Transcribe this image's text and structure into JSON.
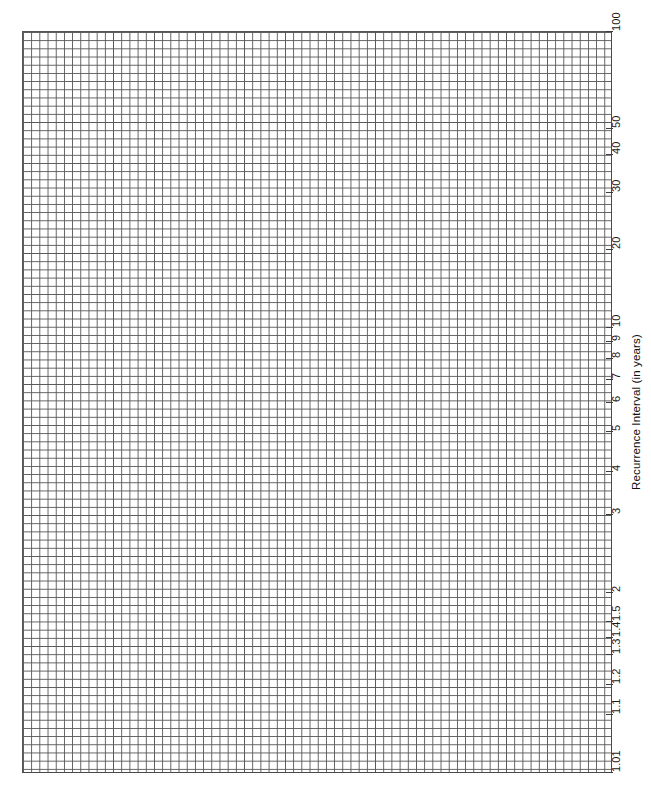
{
  "chart_data": {
    "type": "grid",
    "title": "",
    "subtitle": "",
    "xlabel": "",
    "ylabel": "Recurrence Interval (in years)",
    "grid": "on",
    "grid_style": "uniform fine square grid (graph paper)",
    "legend": "none",
    "series": [],
    "values": [],
    "categories": [],
    "axis": {
      "name": "Recurrence Interval (in years)",
      "orientation": "vertical-right",
      "scale": "gumbel / recurrence-interval probability scale",
      "min": 1.01,
      "max": 100,
      "ticks": [
        {
          "label": "100",
          "value": 100,
          "y": 31
        },
        {
          "label": "50",
          "value": 50,
          "y": 128
        },
        {
          "label": "40",
          "value": 40,
          "y": 154
        },
        {
          "label": "30",
          "value": 30,
          "y": 192
        },
        {
          "label": "20",
          "value": 20,
          "y": 249
        },
        {
          "label": "10",
          "value": 10,
          "y": 327
        },
        {
          "label": "9",
          "value": 9,
          "y": 341
        },
        {
          "label": "8",
          "value": 8,
          "y": 358
        },
        {
          "label": "7",
          "value": 7,
          "y": 379
        },
        {
          "label": "6",
          "value": 6,
          "y": 402
        },
        {
          "label": "5",
          "value": 5,
          "y": 431
        },
        {
          "label": "4",
          "value": 4,
          "y": 471
        },
        {
          "label": "3",
          "value": 3,
          "y": 514
        },
        {
          "label": "2",
          "value": 2,
          "y": 592
        },
        {
          "label": "1.5",
          "value": 1.5,
          "y": 621
        },
        {
          "label": "1.4",
          "value": 1.4,
          "y": 637
        },
        {
          "label": "1.3",
          "value": 1.3,
          "y": 654
        },
        {
          "label": "1.2",
          "value": 1.2,
          "y": 684
        },
        {
          "label": "1.1",
          "value": 1.1,
          "y": 714
        },
        {
          "label": "1.01",
          "value": 1.01,
          "y": 772
        }
      ]
    },
    "plot_area": {
      "left": 22,
      "top": 31,
      "width": 590,
      "height": 741,
      "cell_size_px": 8.2
    },
    "colors": {
      "grid_line": "#575757",
      "frame": "#4a4a4a",
      "text": "#111111",
      "background": "#ffffff"
    }
  }
}
